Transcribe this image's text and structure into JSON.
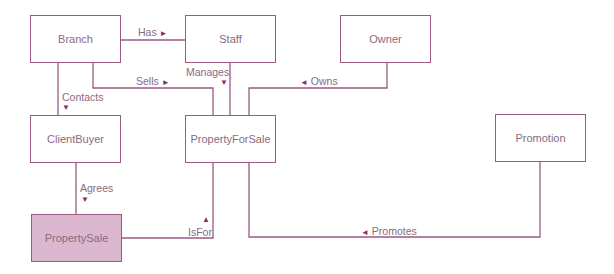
{
  "colors": {
    "line": "#9a5a82",
    "arrow": "#8c2a66",
    "text": "#8a6a80",
    "highlight_fill": "#dcb8d0"
  },
  "entities": [
    {
      "id": "branch",
      "label": "Branch",
      "x": 30,
      "y": 15,
      "w": 91,
      "h": 48
    },
    {
      "id": "staff",
      "label": "Staff",
      "x": 185,
      "y": 15,
      "w": 91,
      "h": 48
    },
    {
      "id": "owner",
      "label": "Owner",
      "x": 340,
      "y": 15,
      "w": 91,
      "h": 48
    },
    {
      "id": "clientbuyer",
      "label": "ClientBuyer",
      "x": 30,
      "y": 115,
      "w": 91,
      "h": 48
    },
    {
      "id": "propertyforsale",
      "label": "PropertyForSale",
      "x": 185,
      "y": 115,
      "w": 91,
      "h": 48
    },
    {
      "id": "promotion",
      "label": "Promotion",
      "x": 495,
      "y": 114,
      "w": 91,
      "h": 48
    },
    {
      "id": "propertysale",
      "label": "PropertySale",
      "x": 31,
      "y": 214,
      "w": 91,
      "h": 48,
      "highlight": true
    }
  ],
  "relationships": [
    {
      "id": "has",
      "label": "Has",
      "arrow": "►",
      "from": "Branch",
      "to": "Staff"
    },
    {
      "id": "sells",
      "label": "Sells",
      "arrow": "►",
      "from": "Branch",
      "to": "PropertyForSale"
    },
    {
      "id": "manages",
      "label": "Manages",
      "arrow": "▼",
      "from": "Staff",
      "to": "PropertyForSale"
    },
    {
      "id": "owns",
      "label": "Owns",
      "arrow": "◄",
      "from": "Owner",
      "to": "PropertyForSale"
    },
    {
      "id": "contacts",
      "label": "Contacts",
      "arrow": "▼",
      "from": "Branch",
      "to": "ClientBuyer"
    },
    {
      "id": "agrees",
      "label": "Agrees",
      "arrow": "▼",
      "from": "ClientBuyer",
      "to": "PropertySale"
    },
    {
      "id": "isfor",
      "label": "IsFor",
      "arrow": "▲",
      "from": "PropertySale",
      "to": "PropertyForSale"
    },
    {
      "id": "promotes",
      "label": "Promotes",
      "arrow": "◄",
      "from": "Promotion",
      "to": "PropertyForSale"
    }
  ]
}
